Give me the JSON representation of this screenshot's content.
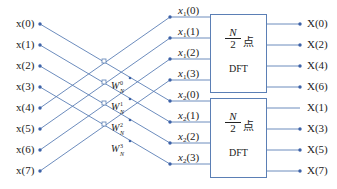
{
  "colors": {
    "line": "#5b7fb5",
    "dot": "#3d62a8",
    "text": "#222222"
  },
  "inputs": [
    "x(0)",
    "x(1)",
    "x(2)",
    "x(3)",
    "x(4)",
    "x(5)",
    "x(6)",
    "x(7)"
  ],
  "mid_top": [
    {
      "base": "x",
      "sub": "1",
      "idx": "(0)"
    },
    {
      "base": "x",
      "sub": "1",
      "idx": "(1)"
    },
    {
      "base": "x",
      "sub": "1",
      "idx": "(2)"
    },
    {
      "base": "x",
      "sub": "1",
      "idx": "(3)"
    }
  ],
  "mid_bottom": [
    {
      "base": "x",
      "sub": "2",
      "idx": "(0)"
    },
    {
      "base": "x",
      "sub": "2",
      "idx": "(1)"
    },
    {
      "base": "x",
      "sub": "2",
      "idx": "(2)"
    },
    {
      "base": "x",
      "sub": "2",
      "idx": "(3)"
    }
  ],
  "twiddles": [
    {
      "base": "W",
      "sub": "N",
      "exp": "0"
    },
    {
      "base": "W",
      "sub": "N",
      "exp": "1"
    },
    {
      "base": "W",
      "sub": "N",
      "exp": "2"
    },
    {
      "base": "W",
      "sub": "N",
      "exp": "3"
    }
  ],
  "dft_blocks": [
    {
      "num": "N",
      "den": "2",
      "suffix": "点",
      "label": "DFT"
    },
    {
      "num": "N",
      "den": "2",
      "suffix": "点",
      "label": "DFT"
    }
  ],
  "outputs_top": [
    "X(0)",
    "X(2)",
    "X(4)",
    "X(6)"
  ],
  "outputs_bottom": [
    "X(1)",
    "X(3)",
    "X(5)",
    "X(7)"
  ]
}
